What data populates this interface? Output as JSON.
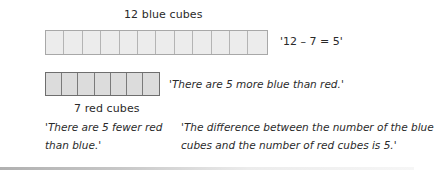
{
  "blue_group": {
    "label": "12 blue cubes",
    "count": 12,
    "fill_color": "#ececec",
    "border_color": "#a8a8a8"
  },
  "red_group": {
    "label": "7 red cubes",
    "count": 7,
    "fill_color": "#dcdcdc",
    "border_color": "#6e6e6e"
  },
  "statements": {
    "equation": "'12 – 7 = 5'",
    "more_blue": "'There are 5 more blue than red.'",
    "fewer_red_line1": "'There are 5 fewer red",
    "fewer_red_line2": "than blue.'",
    "difference_line1": "'The difference between the number of the blue",
    "difference_line2": "cubes and the number of red cubes is 5.'"
  }
}
